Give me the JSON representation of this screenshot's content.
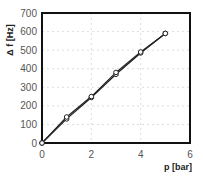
{
  "chart_data": {
    "type": "line",
    "title": "",
    "xlabel": "p [bar]",
    "ylabel": "Δ f [Hz]",
    "xlim": [
      0,
      6
    ],
    "ylim": [
      0,
      700
    ],
    "xticks": [
      0,
      2,
      4,
      6
    ],
    "yticks": [
      0,
      100,
      200,
      300,
      400,
      500,
      600,
      700
    ],
    "grid": true,
    "legend": null,
    "x": [
      0,
      1,
      2,
      3,
      4,
      5
    ],
    "series": [
      {
        "name": "series-1",
        "marker": "open-circle",
        "color": "#222222",
        "values": [
          0,
          130,
          245,
          370,
          485,
          590
        ]
      },
      {
        "name": "series-2",
        "marker": "open-circle",
        "color": "#222222",
        "values": [
          0,
          140,
          250,
          380,
          490,
          590
        ]
      }
    ]
  }
}
